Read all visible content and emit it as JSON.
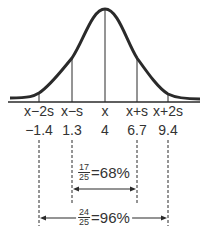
{
  "diagram": {
    "type": "normal-distribution-curve",
    "line_color": "#2a2a2a",
    "markers": [
      {
        "symbol": "x̄−2s",
        "bar": "x",
        "suffix": "−2s",
        "value": "−1.4",
        "x": 39
      },
      {
        "symbol": "x̄−s",
        "bar": "x",
        "suffix": "−s",
        "value": "1.3",
        "x": 72
      },
      {
        "symbol": "x̄",
        "bar": "x",
        "suffix": "",
        "value": "4",
        "x": 105
      },
      {
        "symbol": "x̄+s",
        "bar": "x",
        "suffix": "+s",
        "value": "6.7",
        "x": 137
      },
      {
        "symbol": "x̄+2s",
        "bar": "x",
        "suffix": "+2s",
        "value": "9.4",
        "x": 168
      }
    ],
    "ranges": [
      {
        "name": "one-sd",
        "numerator": "17",
        "denominator": "25",
        "equals": "=68%"
      },
      {
        "name": "two-sd",
        "numerator": "24",
        "denominator": "25",
        "equals": "=96%"
      }
    ]
  }
}
